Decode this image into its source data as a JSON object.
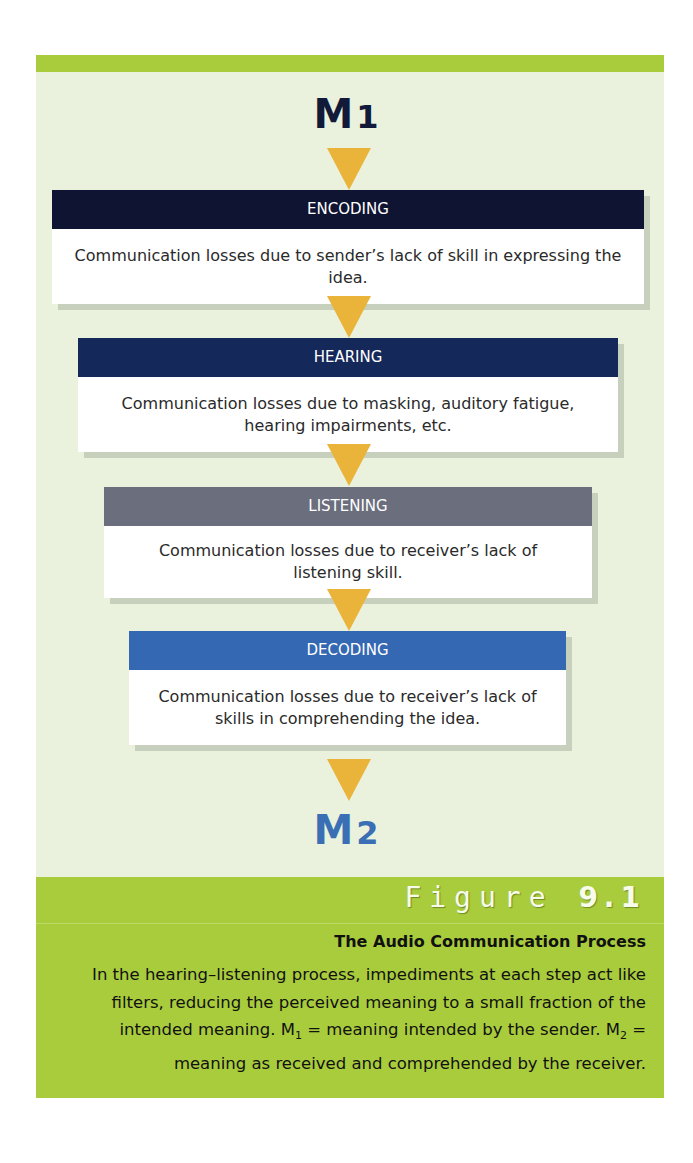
{
  "diagram": {
    "start": {
      "letter": "M",
      "subscript": "1"
    },
    "end": {
      "letter": "M",
      "subscript": "2"
    },
    "steps": [
      {
        "title": "ENCODING",
        "text": "Communication losses due to sender’s lack of skill in expressing the idea.",
        "color": "#0f1433"
      },
      {
        "title": "HEARING",
        "text": "Communication losses due to masking, auditory fatigue, hearing impairments, etc.",
        "color": "#14285a"
      },
      {
        "title": "LISTENING",
        "text": "Communication losses due to receiver’s lack of listening skill.",
        "color": "#6a6e7d"
      },
      {
        "title": "DECODING",
        "text": "Communication losses due to receiver’s lack of skills in comprehending the idea.",
        "color": "#3568b3"
      }
    ],
    "arrow_color": "#eab43a"
  },
  "caption": {
    "figure_word": "Figure",
    "figure_number": "9.1",
    "heading": "The Audio Communication Process",
    "text_part1": "In the hearing–listening process, impediments at each step act like filters, reducing the perceived meaning to a small fraction of the intended meaning. M",
    "sub1": "1",
    "text_part2": " = meaning intended by the sender. M",
    "sub2": "2",
    "text_part3": " = meaning as received and comprehended by the receiver."
  }
}
